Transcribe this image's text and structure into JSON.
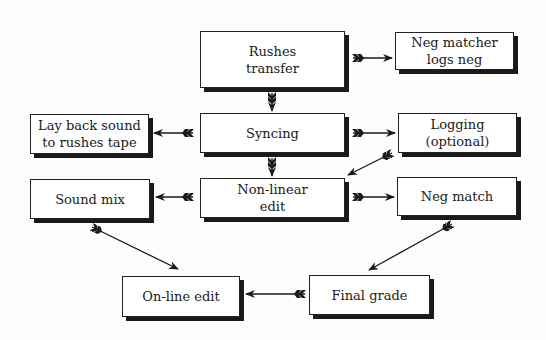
{
  "diagram": {
    "nodes": {
      "rushes_transfer": "Rushes\ntransfer",
      "neg_matcher_logs": "Neg matcher\nlogs neg",
      "syncing": "Syncing",
      "lay_back_sound": "Lay back sound\nto rushes tape",
      "logging": "Logging\n(optional)",
      "non_linear_edit": "Non-linear\nedit",
      "sound_mix": "Sound mix",
      "neg_match": "Neg match",
      "online_edit": "On-line edit",
      "final_grade": "Final grade"
    },
    "edges": [
      {
        "from": "Rushes transfer",
        "to": "Neg matcher logs neg"
      },
      {
        "from": "Rushes transfer",
        "to": "Syncing"
      },
      {
        "from": "Syncing",
        "to": "Lay back sound to rushes tape"
      },
      {
        "from": "Syncing",
        "to": "Logging (optional)"
      },
      {
        "from": "Syncing",
        "to": "Non-linear edit"
      },
      {
        "from": "Logging (optional)",
        "to": "Non-linear edit"
      },
      {
        "from": "Non-linear edit",
        "to": "Sound mix"
      },
      {
        "from": "Non-linear edit",
        "to": "Neg match"
      },
      {
        "from": "Sound mix",
        "to": "On-line edit"
      },
      {
        "from": "Neg match",
        "to": "Final grade"
      },
      {
        "from": "Final grade",
        "to": "On-line edit"
      }
    ]
  }
}
